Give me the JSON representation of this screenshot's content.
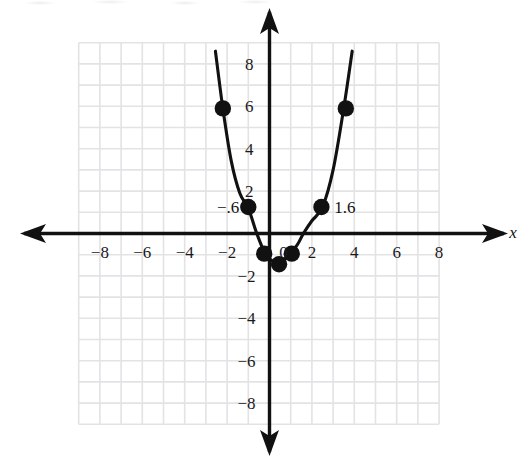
{
  "figure": {
    "kind": "cartesian-coordinate-plane-with-parabola",
    "background": "#ffffff",
    "ink_color": "#111111",
    "grid_color": "#e3e3e6"
  },
  "axes": {
    "x_axis_name": "x",
    "y_axis_name": "",
    "x_ticks_negative": [
      "−8",
      "−6",
      "−4",
      "−2"
    ],
    "x_origin_label": "0",
    "x_ticks_positive": [
      "2",
      "4",
      "6",
      "8"
    ],
    "y_ticks_positive": [
      "8",
      "6",
      "4",
      "2"
    ],
    "y_ticks_negative": [
      "−2",
      "−4",
      "−6",
      "−8"
    ],
    "x_range": [
      -8.5,
      8.5
    ],
    "y_range": [
      -8.5,
      8.5
    ],
    "grid": true,
    "grid_step": 1,
    "grid_extent": [
      -9,
      8,
      -9,
      9
    ]
  },
  "annotations": [
    {
      "text": "−.6",
      "x": -1.95,
      "y": 1.25,
      "name": "left-root-label"
    },
    {
      "text": "1.6",
      "x": 3.55,
      "y": 1.25,
      "name": "right-root-label"
    }
  ],
  "chart_data": {
    "type": "line",
    "title": "",
    "xlabel": "x",
    "ylabel": "",
    "xlim": [
      -8.5,
      8.5
    ],
    "ylim": [
      -8.5,
      8.5
    ],
    "grid": true,
    "legend": "none",
    "curve": {
      "name": "parabola",
      "description": "upward-opening parabola, vertex near (0.5, -1.4), x-intercepts near -0.6 and 1.6",
      "vertex": [
        0.5,
        -1.45
      ],
      "x_intercepts": [
        -0.6,
        1.6
      ],
      "sampled_points": [
        [
          -2.55,
          8.6
        ],
        [
          -2.2,
          5.9
        ],
        [
          -1.8,
          3.4
        ],
        [
          -1.4,
          1.9
        ],
        [
          -1.0,
          1.2
        ],
        [
          -0.6,
          0.0
        ],
        [
          -0.2,
          -0.95
        ],
        [
          0.2,
          -1.35
        ],
        [
          0.5,
          -1.45
        ],
        [
          0.9,
          -1.0
        ],
        [
          1.3,
          -0.55
        ],
        [
          1.6,
          0.0
        ],
        [
          2.0,
          0.6
        ],
        [
          2.5,
          1.25
        ],
        [
          3.0,
          3.0
        ],
        [
          3.5,
          5.9
        ],
        [
          3.9,
          8.6
        ]
      ]
    },
    "marked_points": [
      {
        "x": -2.2,
        "y": 5.9,
        "label": ""
      },
      {
        "x": -1.0,
        "y": 1.25,
        "label": ""
      },
      {
        "x": -0.25,
        "y": -0.95,
        "label": ""
      },
      {
        "x": 0.45,
        "y": -1.45,
        "label": ""
      },
      {
        "x": 1.05,
        "y": -0.95,
        "label": ""
      },
      {
        "x": 2.45,
        "y": 1.25,
        "label": ""
      },
      {
        "x": 3.6,
        "y": 5.9,
        "label": ""
      }
    ]
  }
}
